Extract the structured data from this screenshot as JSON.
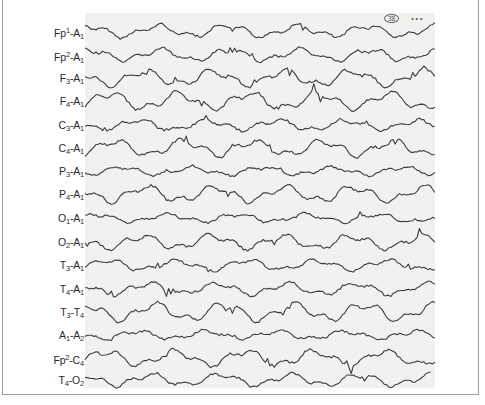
{
  "figure": {
    "type": "EEG recording strip",
    "channels": [
      {
        "id": "fp1-a1",
        "base": "Fp",
        "sup": "1",
        "mid": "-A",
        "sub": "1",
        "tail": "",
        "y": 31,
        "amp": 7
      },
      {
        "id": "fp2-a1",
        "base": "Fp",
        "sup": "2",
        "mid": "-A",
        "sub": "1",
        "tail": "",
        "y": 55,
        "amp": 7
      },
      {
        "id": "f3-a1",
        "base": "F",
        "sup": "",
        "mid": "",
        "sub": "3",
        "tail": "-A1",
        "y": 78,
        "amp": 9
      },
      {
        "id": "f4-a1",
        "base": "F",
        "sup": "",
        "mid": "",
        "sub": "4",
        "tail": "-A1",
        "y": 101,
        "amp": 10
      },
      {
        "id": "c3-a1",
        "base": "C",
        "sup": "",
        "mid": "",
        "sub": "3",
        "tail": "-A1",
        "y": 125,
        "amp": 6
      },
      {
        "id": "c4-a1",
        "base": "C",
        "sup": "",
        "mid": "",
        "sub": "4",
        "tail": "-A1",
        "y": 148,
        "amp": 9
      },
      {
        "id": "p3-a1",
        "base": "P",
        "sup": "",
        "mid": "",
        "sub": "3",
        "tail": "-A1",
        "y": 171,
        "amp": 5
      },
      {
        "id": "p4-a1",
        "base": "P",
        "sup": "",
        "mid": "",
        "sub": "4",
        "tail": "-A1",
        "y": 194,
        "amp": 9
      },
      {
        "id": "o1-a1",
        "base": "O",
        "sup": "",
        "mid": "",
        "sub": "1",
        "tail": "-A1",
        "y": 218,
        "amp": 5
      },
      {
        "id": "o2-a1",
        "base": "O",
        "sup": "",
        "mid": "",
        "sub": "2",
        "tail": "-A1",
        "y": 242,
        "amp": 8
      },
      {
        "id": "t3-a1",
        "base": "T",
        "sup": "",
        "mid": "",
        "sub": "3",
        "tail": "-A1",
        "y": 265,
        "amp": 6
      },
      {
        "id": "t4-a1",
        "base": "T",
        "sup": "",
        "mid": "",
        "sub": "4",
        "tail": "-A1",
        "y": 289,
        "amp": 7
      },
      {
        "id": "t3-t4",
        "base": "T",
        "sup": "",
        "mid": "",
        "sub": "3",
        "tail": "-T4",
        "y": 312,
        "amp": 10
      },
      {
        "id": "a1-a2",
        "base": "A",
        "sup": "",
        "mid": "",
        "sub": "1",
        "tail": "-A2",
        "y": 335,
        "amp": 5
      },
      {
        "id": "fp2-c4",
        "base": "Fp",
        "sup": "2",
        "mid": "-C",
        "sub": "4",
        "tail": "",
        "y": 358,
        "amp": 9
      },
      {
        "id": "t4-o2",
        "base": "T",
        "sup": "",
        "mid": "",
        "sub": "4",
        "tail": "-O2",
        "y": 380,
        "amp": 7
      }
    ],
    "stamp": {
      "circled": "38",
      "trail": "• • •"
    },
    "colors": {
      "trace": "#3c3c3c",
      "strip": "#f1f1f0",
      "frame": "#9a9a9a",
      "label": "#2a2a2a"
    }
  }
}
